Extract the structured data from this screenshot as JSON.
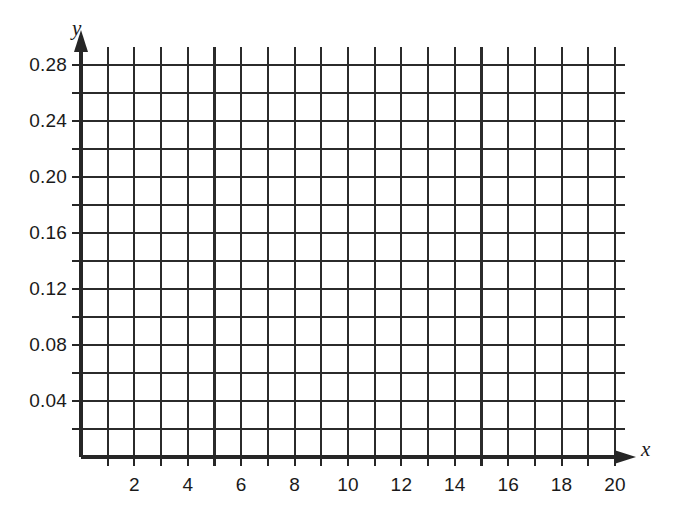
{
  "chart_data": {
    "type": "line",
    "title": "",
    "subtitle": "",
    "xlabel": "x",
    "ylabel": "y",
    "xlim": [
      0,
      21
    ],
    "ylim": [
      0,
      0.3
    ],
    "grid": true,
    "legend": null,
    "series": [],
    "data_points": [],
    "annotations": [],
    "note": "Empty coordinate grid (graph paper) with no plotted data",
    "x_ticks_major": [
      2,
      4,
      6,
      8,
      10,
      12,
      14,
      16,
      18,
      20
    ],
    "x_tick_labels": [
      "2",
      "4",
      "6",
      "8",
      "10",
      "12",
      "14",
      "16",
      "18",
      "20"
    ],
    "x_minor_step": 1,
    "y_ticks_major": [
      0.04,
      0.08,
      0.12,
      0.16,
      0.2,
      0.24,
      0.28
    ],
    "y_tick_labels": [
      "0.04",
      "0.08",
      "0.12",
      "0.16",
      "0.20",
      "0.24",
      "0.28"
    ],
    "y_minor_step": 0.02,
    "colors": {
      "axis": "#262626",
      "grid_major": "#2b2b2b",
      "grid_minor": "#3a3a3a",
      "background": "#ffffff",
      "text": "#1a1a1a"
    }
  },
  "axes": {
    "y_axis_name": "y",
    "x_axis_name": "x"
  },
  "y_labels": [
    {
      "text": "0.28",
      "value": 0.28
    },
    {
      "text": "0.24",
      "value": 0.24
    },
    {
      "text": "0.20",
      "value": 0.2
    },
    {
      "text": "0.16",
      "value": 0.16
    },
    {
      "text": "0.12",
      "value": 0.12
    },
    {
      "text": "0.08",
      "value": 0.08
    },
    {
      "text": "0.04",
      "value": 0.04
    }
  ],
  "x_labels": [
    {
      "text": "2",
      "value": 2
    },
    {
      "text": "4",
      "value": 4
    },
    {
      "text": "6",
      "value": 6
    },
    {
      "text": "8",
      "value": 8
    },
    {
      "text": "10",
      "value": 10
    },
    {
      "text": "12",
      "value": 12
    },
    {
      "text": "14",
      "value": 14
    },
    {
      "text": "16",
      "value": 16
    },
    {
      "text": "18",
      "value": 18
    },
    {
      "text": "20",
      "value": 20
    }
  ]
}
